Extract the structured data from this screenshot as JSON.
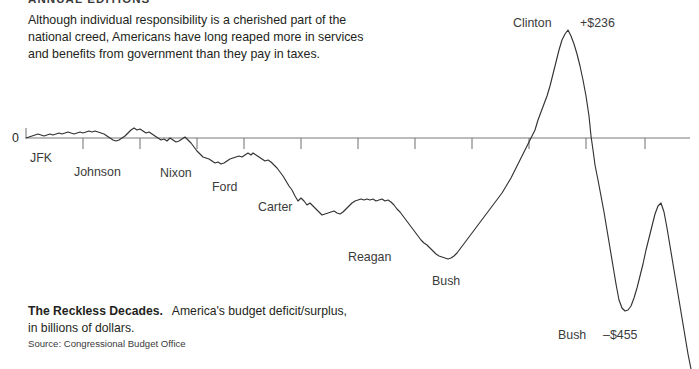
{
  "running_head": "ANNUAL EDITIONS",
  "intro_text": "Although individual responsibility is a cherished part of the national creed, Americans have long reaped more in services and benefits from government than they pay in taxes.",
  "axis": {
    "zero_label": "0",
    "zero_line_color": "#a6a6a6",
    "tick_color": "#6e6e6e",
    "line_color": "#3a3a3a"
  },
  "caption": {
    "lead": "The Reckless Decades.",
    "rest": "America's budget deficit/surplus, in billions of dollars.",
    "source": "Source: Congressional Budget Office"
  },
  "annotations": [
    {
      "name": "jfk",
      "text": "JFK",
      "x": 30,
      "y": 152
    },
    {
      "name": "johnson",
      "text": "Johnson",
      "x": 74,
      "y": 166
    },
    {
      "name": "nixon",
      "text": "Nixon",
      "x": 160,
      "y": 167
    },
    {
      "name": "ford",
      "text": "Ford",
      "x": 212,
      "y": 181
    },
    {
      "name": "carter",
      "text": "Carter",
      "x": 258,
      "y": 201
    },
    {
      "name": "reagan",
      "text": "Reagan",
      "x": 348,
      "y": 251
    },
    {
      "name": "bush-41",
      "text": "Bush",
      "x": 432,
      "y": 275
    },
    {
      "name": "clinton",
      "text": "Clinton",
      "x": 513,
      "y": 17
    },
    {
      "name": "bush-43",
      "text": "Bush",
      "x": 558,
      "y": 329
    }
  ],
  "value_labels": [
    {
      "name": "clinton-surplus-peak",
      "text": "+$236",
      "x": 580,
      "y": 17
    },
    {
      "name": "bush-deficit-trough",
      "text": "–$455",
      "x": 603,
      "y": 329
    }
  ],
  "chart_data": {
    "type": "line",
    "title": "The Reckless Decades.",
    "subtitle": "America's budget deficit/surplus, in billions of dollars.",
    "source": "Congressional Budget Office",
    "xlabel": "",
    "ylabel": "Budget deficit / surplus (billions of dollars)",
    "grid": false,
    "legend": "none",
    "zero_reference_line": 0,
    "annotated_extremes": {
      "max_surplus": 236,
      "max_deficit": -455
    },
    "eras": [
      {
        "label": "JFK",
        "president": "John F. Kennedy"
      },
      {
        "label": "Johnson",
        "president": "Lyndon B. Johnson"
      },
      {
        "label": "Nixon",
        "president": "Richard Nixon"
      },
      {
        "label": "Ford",
        "president": "Gerald Ford"
      },
      {
        "label": "Carter",
        "president": "Jimmy Carter"
      },
      {
        "label": "Reagan",
        "president": "Ronald Reagan"
      },
      {
        "label": "Bush",
        "president": "George H. W. Bush"
      },
      {
        "label": "Clinton",
        "president": "Bill Clinton"
      },
      {
        "label": "Bush",
        "president": "George W. Bush"
      }
    ],
    "axis_tick_x_positions": [
      26,
      83,
      140,
      197,
      244,
      301,
      358,
      415,
      472,
      529,
      586,
      645
    ],
    "series": [
      {
        "name": "Federal budget deficit/surplus",
        "color": "#333333",
        "points": [
          [
            26,
            138
          ],
          [
            29,
            137
          ],
          [
            32,
            136
          ],
          [
            35,
            135
          ],
          [
            38,
            134
          ],
          [
            41,
            135
          ],
          [
            44,
            136
          ],
          [
            47,
            135
          ],
          [
            50,
            134
          ],
          [
            53,
            135
          ],
          [
            56,
            134
          ],
          [
            59,
            133
          ],
          [
            62,
            134
          ],
          [
            65,
            133
          ],
          [
            68,
            132
          ],
          [
            71,
            133
          ],
          [
            74,
            134
          ],
          [
            77,
            133
          ],
          [
            80,
            132
          ],
          [
            83,
            133
          ],
          [
            86,
            132
          ],
          [
            89,
            131
          ],
          [
            92,
            132
          ],
          [
            95,
            131
          ],
          [
            98,
            132
          ],
          [
            101,
            133
          ],
          [
            104,
            134
          ],
          [
            107,
            136
          ],
          [
            110,
            138
          ],
          [
            113,
            140
          ],
          [
            116,
            141
          ],
          [
            119,
            140
          ],
          [
            122,
            138
          ],
          [
            125,
            136
          ],
          [
            128,
            133
          ],
          [
            131,
            130
          ],
          [
            134,
            128
          ],
          [
            137,
            130
          ],
          [
            140,
            129
          ],
          [
            143,
            131
          ],
          [
            146,
            133
          ],
          [
            149,
            132
          ],
          [
            152,
            134
          ],
          [
            155,
            136
          ],
          [
            158,
            138
          ],
          [
            161,
            140
          ],
          [
            164,
            139
          ],
          [
            167,
            141
          ],
          [
            170,
            138
          ],
          [
            173,
            140
          ],
          [
            176,
            142
          ],
          [
            179,
            141
          ],
          [
            182,
            139
          ],
          [
            185,
            137
          ],
          [
            188,
            140
          ],
          [
            191,
            143
          ],
          [
            194,
            147
          ],
          [
            197,
            151
          ],
          [
            200,
            154
          ],
          [
            203,
            157
          ],
          [
            206,
            158
          ],
          [
            209,
            159
          ],
          [
            212,
            161
          ],
          [
            215,
            163
          ],
          [
            218,
            162
          ],
          [
            221,
            164
          ],
          [
            224,
            163
          ],
          [
            227,
            161
          ],
          [
            230,
            159
          ],
          [
            233,
            158
          ],
          [
            236,
            157
          ],
          [
            239,
            156
          ],
          [
            242,
            157
          ],
          [
            245,
            155
          ],
          [
            248,
            153
          ],
          [
            251,
            155
          ],
          [
            253,
            153
          ],
          [
            256,
            155
          ],
          [
            259,
            157
          ],
          [
            262,
            159
          ],
          [
            265,
            161
          ],
          [
            268,
            160
          ],
          [
            271,
            162
          ],
          [
            274,
            165
          ],
          [
            277,
            168
          ],
          [
            280,
            172
          ],
          [
            283,
            176
          ],
          [
            286,
            181
          ],
          [
            289,
            186
          ],
          [
            292,
            190
          ],
          [
            295,
            196
          ],
          [
            298,
            201
          ],
          [
            301,
            198
          ],
          [
            304,
            201
          ],
          [
            307,
            205
          ],
          [
            310,
            203
          ],
          [
            313,
            206
          ],
          [
            316,
            209
          ],
          [
            319,
            212
          ],
          [
            322,
            215
          ],
          [
            325,
            214
          ],
          [
            328,
            213
          ],
          [
            331,
            212
          ],
          [
            334,
            211
          ],
          [
            337,
            213
          ],
          [
            340,
            214
          ],
          [
            343,
            212
          ],
          [
            346,
            209
          ],
          [
            349,
            206
          ],
          [
            352,
            203
          ],
          [
            355,
            201
          ],
          [
            358,
            200
          ],
          [
            361,
            199
          ],
          [
            364,
            200
          ],
          [
            367,
            199
          ],
          [
            370,
            200
          ],
          [
            373,
            199
          ],
          [
            376,
            201
          ],
          [
            379,
            200
          ],
          [
            382,
            199
          ],
          [
            385,
            201
          ],
          [
            388,
            200
          ],
          [
            391,
            202
          ],
          [
            394,
            205
          ],
          [
            397,
            209
          ],
          [
            400,
            212
          ],
          [
            403,
            216
          ],
          [
            406,
            220
          ],
          [
            409,
            224
          ],
          [
            412,
            228
          ],
          [
            415,
            232
          ],
          [
            418,
            236
          ],
          [
            421,
            240
          ],
          [
            424,
            243
          ],
          [
            427,
            245
          ],
          [
            430,
            248
          ],
          [
            433,
            251
          ],
          [
            436,
            254
          ],
          [
            439,
            256
          ],
          [
            442,
            257
          ],
          [
            445,
            258
          ],
          [
            448,
            259
          ],
          [
            451,
            258
          ],
          [
            454,
            256
          ],
          [
            457,
            253
          ],
          [
            460,
            249
          ],
          [
            463,
            245
          ],
          [
            466,
            241
          ],
          [
            469,
            237
          ],
          [
            472,
            233
          ],
          [
            475,
            229
          ],
          [
            478,
            225
          ],
          [
            481,
            221
          ],
          [
            484,
            217
          ],
          [
            487,
            213
          ],
          [
            490,
            209
          ],
          [
            493,
            205
          ],
          [
            496,
            201
          ],
          [
            499,
            197
          ],
          [
            502,
            193
          ],
          [
            505,
            188
          ],
          [
            508,
            183
          ],
          [
            511,
            178
          ],
          [
            514,
            172
          ],
          [
            517,
            166
          ],
          [
            520,
            160
          ],
          [
            523,
            154
          ],
          [
            526,
            148
          ],
          [
            529,
            142
          ],
          [
            532,
            136
          ],
          [
            535,
            130
          ],
          [
            538,
            120
          ],
          [
            541,
            112
          ],
          [
            544,
            104
          ],
          [
            547,
            96
          ],
          [
            550,
            86
          ],
          [
            553,
            74
          ],
          [
            556,
            62
          ],
          [
            559,
            50
          ],
          [
            562,
            40
          ],
          [
            565,
            34
          ],
          [
            568,
            30
          ],
          [
            571,
            36
          ],
          [
            574,
            44
          ],
          [
            577,
            54
          ],
          [
            580,
            66
          ],
          [
            583,
            80
          ],
          [
            586,
            96
          ],
          [
            589,
            116
          ],
          [
            591,
            136
          ],
          [
            593,
            150
          ],
          [
            595,
            165
          ],
          [
            598,
            180
          ],
          [
            601,
            196
          ],
          [
            604,
            212
          ],
          [
            607,
            230
          ],
          [
            610,
            248
          ],
          [
            613,
            266
          ],
          [
            616,
            284
          ],
          [
            619,
            300
          ],
          [
            622,
            308
          ],
          [
            625,
            311
          ],
          [
            628,
            310
          ],
          [
            631,
            306
          ],
          [
            634,
            298
          ],
          [
            637,
            288
          ],
          [
            640,
            276
          ],
          [
            643,
            264
          ],
          [
            646,
            250
          ],
          [
            649,
            238
          ],
          [
            652,
            226
          ],
          [
            655,
            214
          ],
          [
            658,
            206
          ],
          [
            661,
            203
          ],
          [
            664,
            212
          ],
          [
            667,
            228
          ],
          [
            670,
            246
          ],
          [
            673,
            264
          ],
          [
            676,
            282
          ],
          [
            679,
            300
          ],
          [
            682,
            318
          ],
          [
            685,
            336
          ],
          [
            688,
            354
          ],
          [
            691,
            369
          ]
        ]
      }
    ]
  }
}
